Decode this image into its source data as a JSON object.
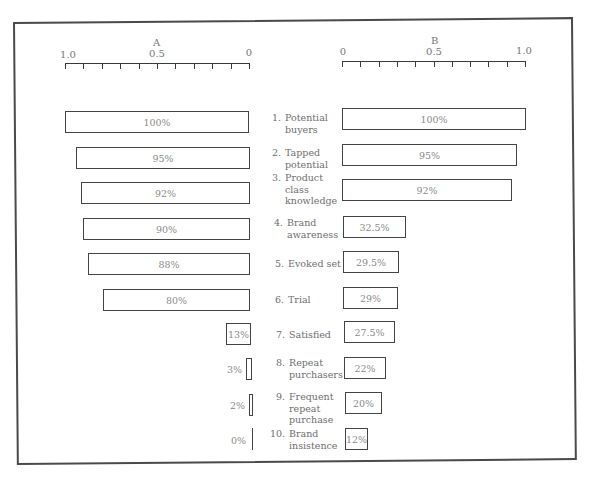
{
  "chart_data": {
    "type": "bar",
    "layout": "back-to-back horizontal bars (tornado/funnel)",
    "panels": [
      {
        "name": "A",
        "axis": {
          "label": "A",
          "ticks": [
            "1.0",
            "0.5",
            "0"
          ],
          "range": [
            1.0,
            0
          ],
          "direction": "right-to-left",
          "minor_ticks": 11
        },
        "values": [
          100,
          95,
          92,
          90,
          88,
          80,
          13,
          3,
          2,
          0
        ],
        "labels": [
          "100%",
          "95%",
          "92%",
          "90%",
          "88%",
          "80%",
          "13%",
          "3%",
          "2%",
          "0%"
        ]
      },
      {
        "name": "B",
        "axis": {
          "label": "B",
          "ticks": [
            "0",
            "0.5",
            "1.0"
          ],
          "range": [
            0,
            1.0
          ],
          "direction": "left-to-right",
          "minor_ticks": 11
        },
        "values": [
          100,
          95,
          92,
          32.5,
          29.5,
          29,
          27.5,
          22,
          20,
          12
        ],
        "labels": [
          "100%",
          "95%",
          "92%",
          "32.5%",
          "29.5%",
          "29%",
          "27.5%",
          "22%",
          "20%",
          "12%"
        ]
      }
    ],
    "categories": [
      "1. Potential buyers",
      "2. Tapped potential",
      "3. Product class knowledge",
      "4. Brand awareness",
      "5. Evoked set",
      "6. Trial",
      "7. Satisfied",
      "8. Repeat purchasers",
      "9. Frequent repeat purchase",
      "10. Brand insistence"
    ],
    "grid": false,
    "legend": null
  },
  "axes": {
    "a": {
      "title": "A",
      "tick_left": "1.0",
      "tick_mid": "0.5",
      "tick_right": "0"
    },
    "b": {
      "title": "B",
      "tick_left": "0",
      "tick_mid": "0.5",
      "tick_right": "1.0"
    }
  },
  "stages": [
    {
      "num": "1.",
      "lines": [
        "Potential",
        "buyers"
      ]
    },
    {
      "num": "2.",
      "lines": [
        "Tapped",
        "potential"
      ]
    },
    {
      "num": "3.",
      "lines": [
        "Product",
        "class",
        "knowledge"
      ]
    },
    {
      "num": "4.",
      "lines": [
        "Brand",
        "awareness"
      ]
    },
    {
      "num": "5.",
      "lines": [
        "Evoked set"
      ]
    },
    {
      "num": "6.",
      "lines": [
        "Trial"
      ]
    },
    {
      "num": "7.",
      "lines": [
        "Satisfied"
      ]
    },
    {
      "num": "8.",
      "lines": [
        "Repeat",
        "purchasers"
      ]
    },
    {
      "num": "9.",
      "lines": [
        "Frequent",
        "repeat",
        "purchase"
      ]
    },
    {
      "num": "10.",
      "lines": [
        "Brand",
        "insistence"
      ]
    }
  ],
  "bars_a": [
    "100%",
    "95%",
    "92%",
    "90%",
    "88%",
    "80%",
    "13%",
    "3%",
    "2%",
    "0%"
  ],
  "bars_b": [
    "100%",
    "95%",
    "92%",
    "32.5%",
    "29.5%",
    "29%",
    "27.5%",
    "22%",
    "20%",
    "12%"
  ]
}
